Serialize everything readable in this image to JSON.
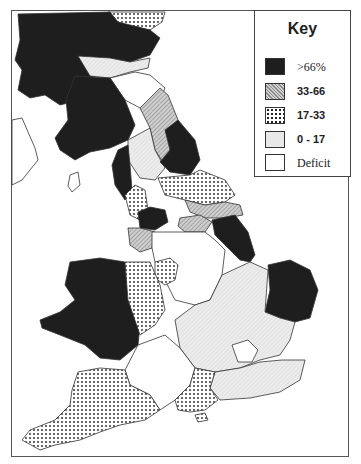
{
  "key": {
    "title": "Key",
    "items": [
      {
        "label": ">66%",
        "pattern": "solid-dark",
        "color": "#1e1e1e"
      },
      {
        "label": "33-66",
        "pattern": "diagonal-hatch",
        "color": "#b8b8b8"
      },
      {
        "label": "17-33",
        "pattern": "dots",
        "color": "#ffffff"
      },
      {
        "label": "0 - 17",
        "pattern": "light-fill",
        "color": "#e8e8e8"
      },
      {
        "label": "Deficit",
        "pattern": "none",
        "color": "#ffffff"
      }
    ]
  },
  "map": {
    "subject": "Great Britain regional map shaded by percentage category",
    "regions": [
      {
        "name": "Scottish Highlands",
        "category": ">66%"
      },
      {
        "name": "Grampian",
        "category": "17-33"
      },
      {
        "name": "Central Scotland",
        "category": "0 - 17"
      },
      {
        "name": "Lothian",
        "category": "Deficit"
      },
      {
        "name": "Borders",
        "category": "33-66"
      },
      {
        "name": "Strathclyde",
        "category": ">66%"
      },
      {
        "name": "Dumfries & Galloway",
        "category": ">66%"
      },
      {
        "name": "Cumbria",
        "category": ">66%"
      },
      {
        "name": "Northumberland",
        "category": "0 - 17"
      },
      {
        "name": "Durham",
        "category": ">66%"
      },
      {
        "name": "North Yorkshire",
        "category": "17-33"
      },
      {
        "name": "Humberside",
        "category": "33-66"
      },
      {
        "name": "Lancashire",
        "category": "17-33"
      },
      {
        "name": "Greater Manchester",
        "category": ">66%"
      },
      {
        "name": "Merseyside/Cheshire",
        "category": "33-66"
      },
      {
        "name": "South Yorkshire",
        "category": "33-66"
      },
      {
        "name": "Lincolnshire",
        "category": ">66%"
      },
      {
        "name": "Norfolk",
        "category": ">66%"
      },
      {
        "name": "Wales",
        "category": ">66%"
      },
      {
        "name": "Shropshire/Hereford",
        "category": "17-33"
      },
      {
        "name": "Staffordshire",
        "category": "17-33"
      },
      {
        "name": "Midlands",
        "category": "Deficit"
      },
      {
        "name": "East Anglia / Home Counties",
        "category": "0 - 17"
      },
      {
        "name": "Greater London",
        "category": "Deficit"
      },
      {
        "name": "Kent / Sussex",
        "category": "0 - 17"
      },
      {
        "name": "Avon / Wiltshire",
        "category": "Deficit"
      },
      {
        "name": "Dorset / Hampshire",
        "category": "17-33"
      },
      {
        "name": "Devon / Cornwall",
        "category": "17-33"
      },
      {
        "name": "Isle of Wight",
        "category": "17-33"
      }
    ]
  }
}
